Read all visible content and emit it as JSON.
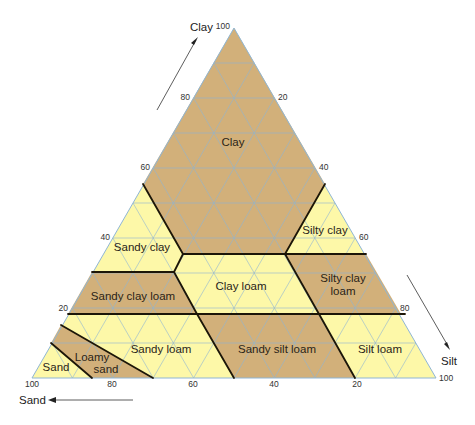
{
  "diagram": {
    "colors": {
      "tan": "#d2b07a",
      "yellow": "#fdf8a8",
      "grid": "#8fb6d6",
      "boundary": "#1c1608"
    },
    "axes": {
      "clay": {
        "label": "Clay",
        "ticks": [
          "100",
          "80",
          "60",
          "40",
          "20"
        ]
      },
      "silt": {
        "label": "Silt",
        "ticks": [
          "20",
          "40",
          "60",
          "80",
          "100"
        ]
      },
      "sand": {
        "label": "Sand",
        "ticks": [
          "100",
          "80",
          "60",
          "40",
          "20"
        ]
      }
    },
    "regions": [
      {
        "name": "Clay",
        "fill": "tan"
      },
      {
        "name": "Sandy clay",
        "fill": "yellow"
      },
      {
        "name": "Silty clay",
        "fill": "yellow"
      },
      {
        "name": "Sandy clay loam",
        "fill": "tan"
      },
      {
        "name": "Clay loam",
        "fill": "yellow"
      },
      {
        "name": "Silty clay loam",
        "fill": "tan"
      },
      {
        "name": "Sand",
        "fill": "yellow"
      },
      {
        "name": "Loamy sand",
        "fill": "tan"
      },
      {
        "name": "Sandy loam",
        "fill": "yellow"
      },
      {
        "name": "Sandy silt loam",
        "fill": "tan"
      },
      {
        "name": "Silt loam",
        "fill": "yellow"
      }
    ],
    "labels": {
      "clay": "Clay",
      "sandy_clay": "Sandy clay",
      "silty_clay": "Silty clay",
      "sandy_clay_loam": "Sandy clay loam",
      "clay_loam": "Clay loam",
      "silty_clay_loam_1": "Silty clay",
      "silty_clay_loam_2": "loam",
      "sand": "Sand",
      "loamy_sand_1": "Loamy",
      "loamy_sand_2": "sand",
      "sandy_loam": "Sandy loam",
      "sandy_silt_loam": "Sandy silt loam",
      "silt_loam": "Silt loam"
    }
  }
}
